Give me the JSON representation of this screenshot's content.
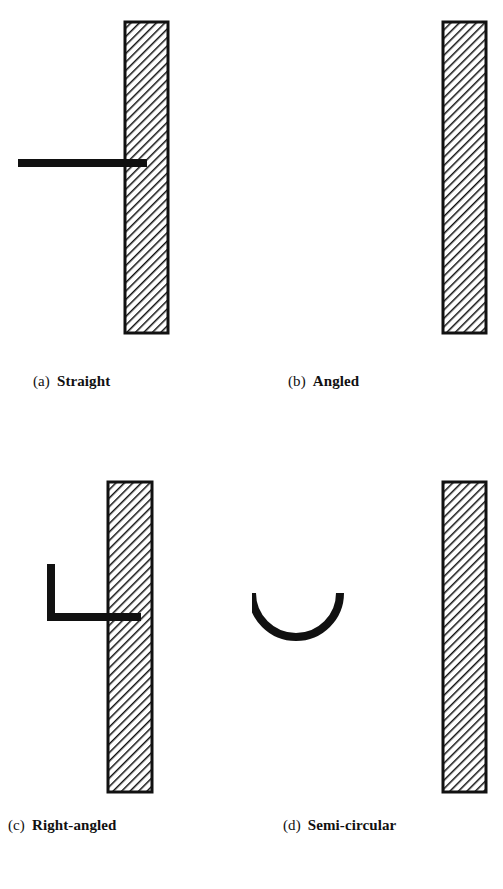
{
  "figure": {
    "type": "technical-diagram",
    "background_color": "#ffffff",
    "ink_color": "#111111",
    "wall": {
      "fill_style": "diagonal-hatch",
      "hatch_angle_deg": 45,
      "hatch_direction": "lower-left to upper-right",
      "hatch_spacing_px": 4,
      "hatch_color": "#111111",
      "border_color": "#111111",
      "border_width_px": 3,
      "interior_color": "#ffffff"
    },
    "bar": {
      "color": "#111111",
      "thickness_px": 8
    }
  },
  "panels": [
    {
      "id": "a",
      "tag": "(a)",
      "label": "Straight",
      "anchor_type": "straight",
      "description": "Bar runs horizontally and terminates flush at the wall face with no hook.",
      "wall": {
        "x": 125,
        "y": 22,
        "width": 43,
        "height": 311
      },
      "bar_geometry": {
        "kind": "polyline",
        "points": [
          [
            18,
            163
          ],
          [
            147,
            163
          ]
        ],
        "thickness": 8
      }
    },
    {
      "id": "b",
      "tag": "(b)",
      "label": "Angled",
      "anchor_type": "angled",
      "description": "Bar enters the wall horizontally then bends upward at roughly 38 degrees away from the wall face.",
      "wall": {
        "x": 191,
        "y": 22,
        "width": 43,
        "height": 311
      },
      "bar_geometry": {
        "kind": "polyline",
        "points": [
          [
            83,
            126
          ],
          [
            131,
            163
          ],
          [
            192,
            163
          ]
        ],
        "thickness": 8
      }
    },
    {
      "id": "c",
      "tag": "(c)",
      "label": "Right-angled",
      "anchor_type": "right-angled",
      "description": "Bar enters the wall horizontally then turns through 90 degrees to form a vertical leg pointing upward.",
      "wall": {
        "x": 108,
        "y": 37,
        "width": 44,
        "height": 310
      },
      "bar_geometry": {
        "kind": "polyline",
        "points": [
          [
            51,
            564
          ],
          [
            51,
            617
          ],
          [
            141,
            617
          ]
        ],
        "thickness": 8
      }
    },
    {
      "id": "d",
      "tag": "(d)",
      "label": "Semi-circular",
      "anchor_type": "semi-circular",
      "description": "Bar terminates in a semi-circular hook that loops down and back toward the wall face.",
      "wall": {
        "x": 191,
        "y": 37,
        "width": 43,
        "height": 310
      },
      "bar_geometry": {
        "kind": "arc",
        "center": [
          44,
          148
        ],
        "radius": 44,
        "start_angle_deg": 180,
        "end_angle_deg": 0,
        "sweep": "clockwise-downward",
        "thickness": 8
      }
    }
  ],
  "bottom_caption": {
    "text": ""
  }
}
